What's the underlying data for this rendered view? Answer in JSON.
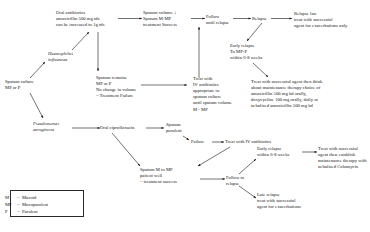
{
  "diagram": {
    "accent_color": "#141414",
    "nodes": {
      "oral_antibiotics": "Oral antibiotics\namoxicillin 500 mg tds\ncan be increased to 1g tds",
      "sputum_volume_success": "Sputum volume ↓\nSputum M-MP\ntreatment Success",
      "follow_until_relapse": "Follow\nuntil relapse",
      "relapse": "Relapse",
      "relapse_late": "Relapse late\ntreat with successful\nagent for exacerbations only",
      "early_relapse": "Early relapse\nTo MP-P\nwithin 6-8 weeks",
      "haemophilus": "Haemophilus\ninfluenzae",
      "sputum_culture": "Sputum culture\nMP or P",
      "sputum_remains": "Sputum remains\nMP or P\nNo change in volume\n= Treatment Failure",
      "treat_iv": "Treat with\nIV antibiotics\nappropriate to\nsputum culture\nuntil sputum volume\nM - MP",
      "maintenance": "Treat with successful agent then think\nabout maintenance therapy choice of\namoxicillin 500 mg bd orally,\ndoxycycline 100 mg orally, daily or\nnebulised amoxicillin 500 mg bd",
      "pseudomonas": "Pseudomonas\naeruginosa",
      "oral_cipro": "Oral ciprofloxacin",
      "sputum_purulent": "Sputum\npurulent",
      "failure": "Failure",
      "treat_iv_short": "Treat with IV antibiotics",
      "sputum_m_to_mp": "Sputum M to MP\npatient well\n= treatment success",
      "follow_to_relapse": "Follow to\nrelapse",
      "early_relapse_2": "Early relapse\nwithin 6-8 weeks",
      "colomycin": "Treat with successful\nagent then establish\nmaintenance therapy with\nnebulised Colomycin",
      "late_relapse": "Late relapse\ntreat with successful\nagent for exacerbations"
    },
    "legend": [
      {
        "key": "M",
        "eq": "=",
        "value": "Mucoid"
      },
      {
        "key": "MP",
        "eq": "=",
        "value": "Mucopurulent"
      },
      {
        "key": "P",
        "eq": "=",
        "value": "Purulent"
      }
    ]
  }
}
